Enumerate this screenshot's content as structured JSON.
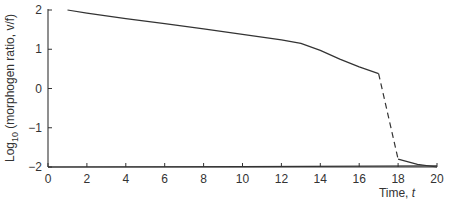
{
  "chart_data": {
    "type": "line",
    "title": "",
    "xlabel": "Time, t",
    "ylabel": "Log10 (morphogen ratio, v/f)",
    "ylabel_parts": {
      "pre": "Log",
      "sub": "10",
      "post": " (morphogen ratio, v/f)"
    },
    "xlim": [
      0,
      20
    ],
    "ylim": [
      -2,
      2
    ],
    "xticks": [
      0,
      2,
      4,
      6,
      8,
      10,
      12,
      14,
      16,
      18,
      20
    ],
    "yticks": [
      2,
      1,
      0,
      -1,
      -2
    ],
    "ytick_labels": [
      "2",
      "1",
      "0",
      "−1",
      "−2"
    ],
    "grid": false,
    "legend": null,
    "series": [
      {
        "name": "morphogen ratio (solid, decline)",
        "style": "solid",
        "x": [
          1,
          2,
          4,
          6,
          8,
          10,
          12,
          13,
          14,
          15,
          16,
          17
        ],
        "y": [
          2.0,
          1.92,
          1.78,
          1.65,
          1.52,
          1.38,
          1.24,
          1.15,
          0.97,
          0.75,
          0.55,
          0.38
        ]
      },
      {
        "name": "morphogen ratio (dashed, collapse)",
        "style": "dashed",
        "x": [
          17,
          18
        ],
        "y": [
          0.38,
          -1.8
        ]
      },
      {
        "name": "morphogen ratio (solid, tail)",
        "style": "solid",
        "x": [
          18,
          19,
          20
        ],
        "y": [
          -1.8,
          -1.93,
          -2.0
        ]
      },
      {
        "name": "baseline trace",
        "style": "solid",
        "x": [
          0,
          10,
          20
        ],
        "y": [
          -2.0,
          -1.99,
          -1.97
        ]
      }
    ]
  }
}
